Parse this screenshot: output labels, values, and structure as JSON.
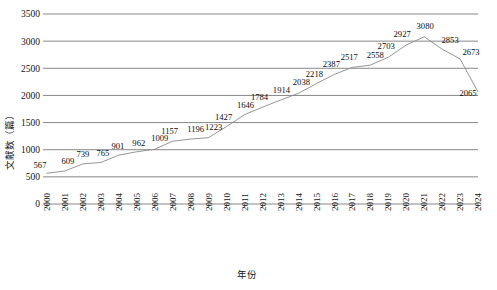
{
  "chart_data": {
    "type": "line",
    "title": "",
    "xlabel": "年份",
    "ylabel": "文献数（篇）",
    "categories": [
      "2000",
      "2001",
      "2002",
      "2003",
      "2004",
      "2005",
      "2006",
      "2007",
      "2008",
      "2009",
      "2010",
      "2011",
      "2012",
      "2013",
      "2014",
      "2015",
      "2016",
      "2017",
      "2018",
      "2019",
      "2020",
      "2021",
      "2022",
      "2023",
      "2024"
    ],
    "values": [
      567,
      609,
      739,
      765,
      901,
      962,
      1009,
      1157,
      1196,
      1223,
      1427,
      1646,
      1784,
      1914,
      2038,
      2218,
      2387,
      2517,
      2558,
      2703,
      2927,
      3080,
      2853,
      2673,
      2065
    ],
    "series": [
      {
        "name": "文献数",
        "values": [
          567,
          609,
          739,
          765,
          901,
          962,
          1009,
          1157,
          1196,
          1223,
          1427,
          1646,
          1784,
          1914,
          2038,
          2218,
          2387,
          2517,
          2558,
          2703,
          2927,
          3080,
          2853,
          2673,
          2065
        ]
      }
    ],
    "ylim": [
      0,
      3500
    ],
    "yticks": [
      0,
      500,
      1000,
      1500,
      2000,
      2500,
      3000,
      3500
    ],
    "ytick_labels": [
      "0",
      "500",
      "1000",
      "1500",
      "2000",
      "2500",
      "3000",
      "3500"
    ],
    "grid": true,
    "grid_axis": "y",
    "legend": false,
    "legend_position": "none",
    "line_color": "#8a8a8a",
    "grid_color": "#7a7a7a",
    "text_color": "#141414",
    "background": "#ffffff",
    "data_labels": true,
    "xtick_rotation": -90
  }
}
